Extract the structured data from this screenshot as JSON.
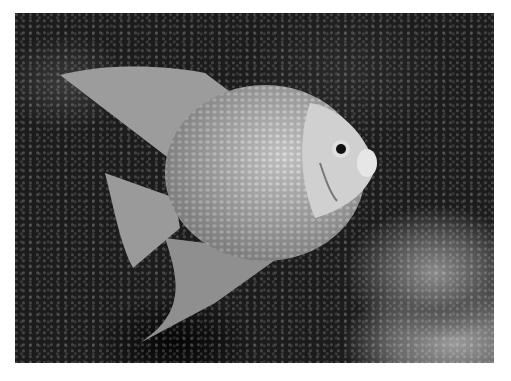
{
  "image": {
    "subject": "gray angelfish",
    "scene": "fish swimming over dark rocky reef",
    "palette": {
      "background": "#1c1c1c",
      "fish_body": "#b8b8b8",
      "fish_head": "#d4d4d4",
      "border": "#ffffff"
    }
  }
}
